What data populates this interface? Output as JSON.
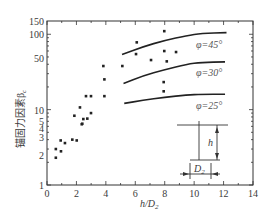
{
  "chart_data": {
    "type": "scatter",
    "title": "",
    "xlabel": "h/D₂",
    "ylabel": "锚固力因素β_c",
    "xlim": [
      0,
      14
    ],
    "ylim": [
      1,
      150
    ],
    "yscale": "log",
    "grid": false,
    "x_ticks": [
      0,
      2,
      4,
      6,
      8,
      10,
      12,
      14
    ],
    "y_ticks": [
      {
        "label": "150",
        "value": 150
      },
      {
        "label": "100",
        "value": 100
      },
      {
        "label": "50",
        "value": 50
      },
      {
        "label": "10",
        "value": 10
      },
      {
        "label": "5",
        "value": 5
      },
      {
        "label": "4",
        "value": 4
      },
      {
        "label": "3",
        "value": 3
      },
      {
        "label": "2",
        "value": 2
      },
      {
        "label": "1",
        "value": 1
      }
    ],
    "series": [
      {
        "name": "experimental data",
        "type": "scatter",
        "points": [
          [
            0.6,
            2.3
          ],
          [
            0.6,
            3.0
          ],
          [
            0.95,
            2.8
          ],
          [
            0.93,
            3.9
          ],
          [
            1.22,
            3.6
          ],
          [
            1.72,
            4.0
          ],
          [
            2.02,
            3.9
          ],
          [
            1.86,
            8.3
          ],
          [
            2.36,
            6.4
          ],
          [
            2.24,
            10.7
          ],
          [
            2.47,
            7.5
          ],
          [
            2.4,
            6.5
          ],
          [
            2.74,
            7.6
          ],
          [
            2.99,
            9.0
          ],
          [
            2.65,
            15.1
          ],
          [
            2.99,
            15.1
          ],
          [
            3.9,
            15.1
          ],
          [
            3.83,
            37.9
          ],
          [
            3.9,
            25.2
          ],
          [
            5.12,
            37.9
          ],
          [
            6.1,
            78.1
          ],
          [
            6.05,
            54.6
          ],
          [
            7.07,
            45.5
          ],
          [
            7.97,
            110
          ],
          [
            7.97,
            59.9
          ],
          [
            8.77,
            58.1
          ],
          [
            8.14,
            43.7
          ],
          [
            7.93,
            23.2
          ],
          [
            7.93,
            17.5
          ]
        ]
      },
      {
        "name": "φ=45°",
        "type": "line",
        "points": [
          [
            5.1,
            54
          ],
          [
            6.5,
            68
          ],
          [
            8,
            83
          ],
          [
            9.5,
            96
          ],
          [
            10.5,
            103
          ],
          [
            12.2,
            105
          ]
        ]
      },
      {
        "name": "φ=30°",
        "type": "line",
        "points": [
          [
            5.2,
            22.3
          ],
          [
            6.5,
            28
          ],
          [
            8,
            34
          ],
          [
            9.5,
            40
          ],
          [
            10.5,
            42.5
          ],
          [
            12.1,
            43
          ]
        ]
      },
      {
        "name": "φ=25°",
        "type": "line",
        "points": [
          [
            5.25,
            12.1
          ],
          [
            6.5,
            13.3
          ],
          [
            8,
            14.6
          ],
          [
            9.5,
            15.6
          ],
          [
            10.5,
            16
          ],
          [
            12.1,
            16
          ]
        ]
      }
    ],
    "annotations": [
      {
        "text": "φ=45°",
        "x": 10.3,
        "y": 75
      },
      {
        "text": "φ=30°",
        "x": 10.3,
        "y": 30
      },
      {
        "text": "φ=25°",
        "x": 10.3,
        "y": 11
      }
    ],
    "inset": {
      "description": "anchor schematic",
      "height_label": "h",
      "diameter_label": "D",
      "diameter_subscript": "2"
    }
  },
  "labels": {
    "xlabel_main": "h/D",
    "xlabel_sub": "2",
    "ylabel_main": "锚固力因素β",
    "ylabel_sub": "c",
    "curve_45": "φ=45°",
    "curve_30": "φ=30°",
    "curve_25": "φ=25°",
    "inset_h": "h",
    "inset_D": "D",
    "inset_D_sub": "2"
  }
}
